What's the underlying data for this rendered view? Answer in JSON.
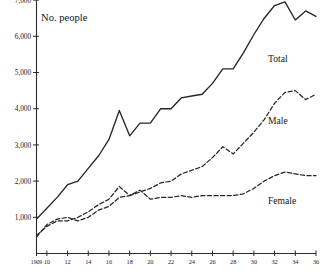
{
  "chart_data": {
    "type": "line",
    "title": "No. people",
    "xlabel": "",
    "ylabel": "No. people",
    "grid": false,
    "legend_position": "right-inline",
    "ylim": [
      0,
      7400
    ],
    "xlim": [
      1909,
      1936
    ],
    "yticks": [
      "1,000",
      "2,000",
      "3,000",
      "4,000",
      "5,000",
      "6,000",
      "7,000"
    ],
    "ytick_values": [
      1000,
      2000,
      3000,
      4000,
      5000,
      6000,
      7000
    ],
    "xticks": [
      "1909",
      "10",
      "12",
      "14",
      "16",
      "18",
      "20",
      "22",
      "24",
      "26",
      "28",
      "30",
      "32",
      "34",
      "36"
    ],
    "xtick_values": [
      1909,
      1910,
      1912,
      1914,
      1916,
      1918,
      1920,
      1922,
      1924,
      1926,
      1928,
      1930,
      1932,
      1934,
      1936
    ],
    "x": [
      1909,
      1910,
      1911,
      1912,
      1913,
      1914,
      1915,
      1916,
      1917,
      1918,
      1919,
      1920,
      1921,
      1922,
      1923,
      1924,
      1925,
      1926,
      1927,
      1928,
      1929,
      1930,
      1931,
      1932,
      1933,
      1934,
      1935,
      1936
    ],
    "series": [
      {
        "name": "Total",
        "style": "solid",
        "values": [
          950,
          1250,
          1550,
          1900,
          2000,
          2350,
          2700,
          3150,
          3950,
          3250,
          3600,
          3600,
          4000,
          4000,
          4300,
          4350,
          4400,
          4700,
          5100,
          5100,
          5550,
          6050,
          6500,
          6850,
          6950,
          6450,
          6700,
          6550
        ]
      },
      {
        "name": "Male",
        "style": "dashed",
        "values": [
          500,
          750,
          900,
          900,
          1000,
          1150,
          1350,
          1500,
          1850,
          1600,
          1700,
          1800,
          1950,
          2000,
          2200,
          2300,
          2400,
          2650,
          2950,
          2750,
          3050,
          3350,
          3700,
          4150,
          4450,
          4500,
          4250,
          4400
        ]
      },
      {
        "name": "Female",
        "style": "dashed",
        "values": [
          450,
          800,
          950,
          1000,
          900,
          1000,
          1200,
          1300,
          1550,
          1600,
          1750,
          1500,
          1550,
          1550,
          1600,
          1550,
          1600,
          1600,
          1600,
          1600,
          1650,
          1800,
          2000,
          2150,
          2250,
          2200,
          2150,
          2150
        ]
      }
    ],
    "series_label_positions": [
      {
        "name": "Total",
        "x": 268,
        "y": 62
      },
      {
        "name": "Male",
        "x": 268,
        "y": 124
      },
      {
        "name": "Female",
        "x": 268,
        "y": 204
      }
    ]
  }
}
